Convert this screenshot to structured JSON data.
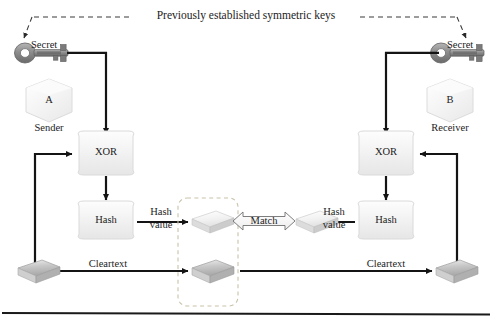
{
  "diagram": {
    "title": "Previously established symmetric keys",
    "sender": {
      "key_label": "Secret",
      "entity_letter": "A",
      "role_label": "Sender",
      "xor_label": "XOR",
      "hash_label": "Hash",
      "hash_value_label_line1": "Hash",
      "hash_value_label_line2": "value",
      "cleartext_label": "Cleartext"
    },
    "receiver": {
      "key_label": "Secret",
      "entity_letter": "B",
      "role_label": "Receiver",
      "xor_label": "XOR",
      "hash_label": "Hash",
      "hash_value_label_line1": "Hash",
      "hash_value_label_line2": "value",
      "cleartext_label": "Cleartext"
    },
    "comparison": {
      "match_label": "Match"
    },
    "colors": {
      "ink": "#1c1c1c",
      "arrow": "#141414",
      "dashed_box": "#c9c3aa",
      "key_body": "#8e8e8e",
      "key_dark": "#6d6d6d",
      "hex_fill": "#f3f3f3",
      "hex_stroke": "#d6d6d6",
      "box_fill": "#f2f2f2",
      "box_stroke": "#d8d8d8",
      "slab_light": "#f0f0f0",
      "slab_gray": "#b9b9b9",
      "rule": "#1a1a1a"
    }
  }
}
